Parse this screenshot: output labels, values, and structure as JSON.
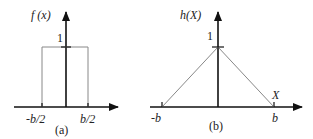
{
  "panel_a": {
    "y_label": "f (x)",
    "peak_label": "1",
    "left_tick_label": "-b/2",
    "right_tick_label": "b/2",
    "caption": "(a)",
    "shape": "rectangle",
    "height": 1,
    "x_range": [
      "-b/2",
      "b/2"
    ]
  },
  "panel_b": {
    "y_label": "h(X)",
    "peak_label": "1",
    "left_tick_label": "-b",
    "right_tick_label": "b",
    "axis_label": "X",
    "caption": "(b)",
    "shape": "triangle",
    "height": 1,
    "x_range": [
      "-b",
      "b"
    ]
  },
  "colors": {
    "axis": "#111111",
    "curve": "#888888"
  }
}
